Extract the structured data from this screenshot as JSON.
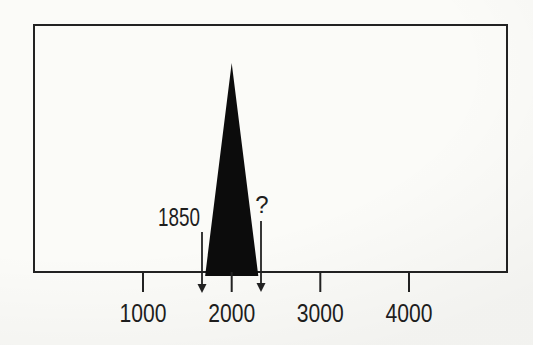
{
  "figure": {
    "background": "#fbfbf8",
    "ink": "#222222",
    "spike_fill": "#0c0c0c",
    "text_color": "#1e1e1e"
  },
  "chart_data": {
    "type": "area",
    "title": "",
    "xlabel": "",
    "ylabel": "",
    "x_ticks": [
      1000,
      2000,
      3000,
      4000
    ],
    "x_tick_labels": [
      "1000",
      "2000",
      "3000",
      "4000"
    ],
    "x_range": [
      -250,
      5100
    ],
    "y_range": [
      0,
      1.1
    ],
    "grid": false,
    "legend": false,
    "frame": true,
    "series": [
      {
        "name": "spike",
        "shape": "filled-triangle",
        "fill": "#0c0c0c",
        "points": [
          [
            1700,
            0
          ],
          [
            2000,
            1
          ],
          [
            2300,
            0
          ]
        ]
      }
    ],
    "annotations": [
      {
        "label": "1850",
        "x": 1850,
        "arrow": "down"
      },
      {
        "label": "?",
        "x": null,
        "arrow": "down"
      }
    ]
  }
}
